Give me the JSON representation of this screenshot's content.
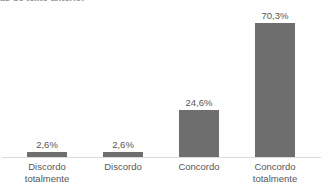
{
  "clipped_heading_fragment": "as de texto anterior",
  "colors": {
    "bar": "#6e6e6e",
    "axis_line": "#dcdcdc",
    "label_text": "#575757",
    "background": "#fefefe"
  },
  "chart_data": {
    "type": "bar",
    "title": "",
    "subtitle": "",
    "xlabel": "",
    "ylabel": "",
    "ylim": [
      0,
      77
    ],
    "grid": false,
    "legend": false,
    "legend_position": "none",
    "value_labels_shown": true,
    "orientation": "vertical",
    "categories": [
      "Discordo totalmente",
      "Discordo",
      "Concordo",
      "Concordo totalmente"
    ],
    "category_lines": [
      [
        "Discordo",
        "totalmente"
      ],
      [
        "Discordo"
      ],
      [
        "Concordo"
      ],
      [
        "Concordo",
        "totalmente"
      ]
    ],
    "values": [
      2.6,
      2.6,
      24.6,
      70.3
    ],
    "value_labels": [
      "2,6%",
      "2,6%",
      "24,6%",
      "70,3%"
    ],
    "tick_labels": [],
    "annotations": []
  }
}
